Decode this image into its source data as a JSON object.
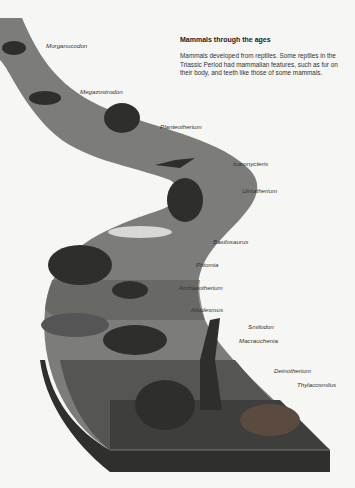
{
  "header": {
    "title": "Mammals through the ages",
    "intro": "Mammals developed from reptiles. Some reptiles in the Triassic Period had mammalian features, such as fur on their body, and teeth like those of some mammals."
  },
  "labels": [
    {
      "name": "Morganucodon",
      "x": 46,
      "y": 42
    },
    {
      "name": "Megazostrodon",
      "x": 80,
      "y": 88
    },
    {
      "name": "Planteotherium",
      "x": 160,
      "y": 123
    },
    {
      "name": "Icaronycteris",
      "x": 233,
      "y": 160
    },
    {
      "name": "Uintatherium",
      "x": 242,
      "y": 187
    },
    {
      "name": "Basilosaurus",
      "x": 213,
      "y": 238
    },
    {
      "name": "Phiomia",
      "x": 196,
      "y": 261
    },
    {
      "name": "Archaeotherium",
      "x": 179,
      "y": 284
    },
    {
      "name": "Allodesmus",
      "x": 191,
      "y": 306
    },
    {
      "name": "Smilodon",
      "x": 248,
      "y": 323
    },
    {
      "name": "Macrauchenia",
      "x": 239,
      "y": 337
    },
    {
      "name": "Deinotherium",
      "x": 274,
      "y": 367
    },
    {
      "name": "Thylacosmilus",
      "x": 297,
      "y": 381
    }
  ],
  "colors": {
    "background": "#f6f6f4",
    "path_light": "#8a8a88",
    "path_mid": "#6e6e6c",
    "path_dark": "#4a4a48",
    "path_edge": "#333331",
    "animal": "#2e2e2c"
  }
}
